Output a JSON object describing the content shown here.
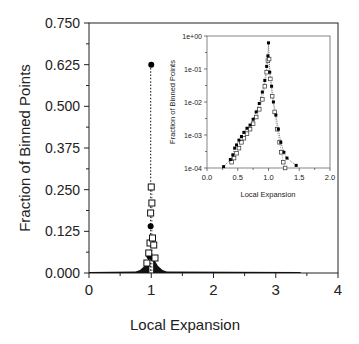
{
  "chart_data": [
    {
      "type": "scatter",
      "title": "",
      "xlabel": "Local Expansion",
      "ylabel": "Fraction of Binned Points",
      "xlim": [
        0,
        4
      ],
      "ylim": [
        0,
        0.75
      ],
      "xticks": [
        "0",
        "1",
        "2",
        "3",
        "4"
      ],
      "yticks": [
        "0.000",
        "0.125",
        "0.250",
        "0.375",
        "0.500",
        "0.625",
        "0.750"
      ],
      "grid": false,
      "legend": null,
      "series": [
        {
          "name": "filled circles (dotted)",
          "marker": "filled-circle",
          "x": [
            0.05,
            0.5,
            0.8,
            0.9,
            0.95,
            0.97,
            0.99,
            1.0,
            1.01,
            1.03,
            1.05,
            1.1,
            1.2,
            1.5,
            2.0,
            2.5,
            3.0,
            3.4
          ],
          "y": [
            0.002,
            0.003,
            0.006,
            0.015,
            0.03,
            0.05,
            0.14,
            0.625,
            0.1,
            0.045,
            0.02,
            0.01,
            0.005,
            0.002,
            0.001,
            0.0008,
            0.0005,
            0.0003
          ]
        },
        {
          "name": "open squares (dotted)",
          "marker": "open-square",
          "x": [
            0.9,
            0.93,
            0.96,
            0.98,
            0.99,
            1.0,
            1.01,
            1.02,
            1.04,
            1.06,
            1.1
          ],
          "y": [
            0.012,
            0.03,
            0.06,
            0.09,
            0.18,
            0.258,
            0.21,
            0.105,
            0.084,
            0.045,
            0.012
          ]
        }
      ],
      "annotations": []
    },
    {
      "type": "scatter",
      "title": "",
      "xlabel": "Local Expansion",
      "ylabel": "Fraction of Binned Points",
      "xscale": "linear",
      "yscale": "log",
      "xlim": [
        0.0,
        2.0
      ],
      "ylim": [
        0.0001,
        1
      ],
      "xticks": [
        "0.0",
        "0.5",
        "1.0",
        "1.5",
        "2.0"
      ],
      "yticks": [
        "1e-04",
        "1e-03",
        "1e-02",
        "1e-01",
        "1e+00"
      ],
      "grid": false,
      "position": "inset upper right",
      "series": [
        {
          "name": "filled circles",
          "marker": "filled-circle",
          "x": [
            0.27,
            0.38,
            0.42,
            0.45,
            0.48,
            0.52,
            0.56,
            0.6,
            0.65,
            0.7,
            0.75,
            0.8,
            0.85,
            0.9,
            0.94,
            0.97,
            0.99,
            1.0,
            1.02,
            1.05,
            1.08,
            1.12,
            1.16,
            1.2,
            1.25,
            1.3,
            1.45
          ],
          "y": [
            0.00011,
            0.00018,
            0.00025,
            0.0004,
            0.0005,
            0.0007,
            0.0009,
            0.0012,
            0.0016,
            0.002,
            0.003,
            0.005,
            0.009,
            0.02,
            0.045,
            0.12,
            0.25,
            0.62,
            0.08,
            0.03,
            0.01,
            0.004,
            0.0015,
            0.0006,
            0.0003,
            0.0002,
            0.00012
          ]
        },
        {
          "name": "open squares",
          "marker": "open-square",
          "x": [
            0.4,
            0.44,
            0.48,
            0.52,
            0.56,
            0.6,
            0.65,
            0.7,
            0.75,
            0.8,
            0.85,
            0.9,
            0.94,
            0.97,
            0.99,
            1.01,
            1.03,
            1.06,
            1.1,
            1.14,
            1.18,
            1.21,
            1.24,
            1.27
          ],
          "y": [
            0.00015,
            0.0002,
            0.00028,
            0.0004,
            0.0006,
            0.0008,
            0.0011,
            0.0015,
            0.0022,
            0.0035,
            0.006,
            0.012,
            0.03,
            0.08,
            0.18,
            0.2,
            0.05,
            0.015,
            0.005,
            0.0015,
            0.0006,
            0.0003,
            0.00015,
            0.0001
          ]
        }
      ]
    }
  ]
}
